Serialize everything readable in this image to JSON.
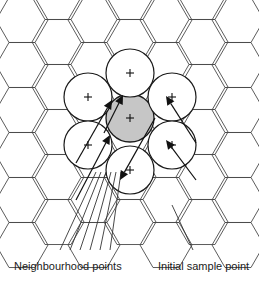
{
  "figure": {
    "background_color": "#ffffff",
    "width": 259,
    "height": 283
  },
  "colors": {
    "hex_stroke": "#4a4a4a",
    "circle_stroke": "#1a1a1a",
    "circle_fill": "#ffffff",
    "shaded_fill": "#c6c6c6",
    "arrow": "#111111",
    "leader": "#333333",
    "text": "#1b1b1b"
  },
  "grid": {
    "type": "hexagonal",
    "orientation": "flat-top",
    "hex_radius": 26,
    "columns": 5,
    "rows": 6,
    "hexagons": [
      {
        "cx": 22,
        "cy": 20
      },
      {
        "cx": 22,
        "cy": 65
      },
      {
        "cx": 22,
        "cy": 110
      },
      {
        "cx": 22,
        "cy": 155
      },
      {
        "cx": 22,
        "cy": 200
      },
      {
        "cx": 22,
        "cy": 245
      },
      {
        "cx": 58,
        "cy": 42
      },
      {
        "cx": 58,
        "cy": 87
      },
      {
        "cx": 58,
        "cy": 132
      },
      {
        "cx": 58,
        "cy": 177
      },
      {
        "cx": 58,
        "cy": 222
      },
      {
        "cx": 58,
        "cy": -3
      },
      {
        "cx": 94,
        "cy": 20
      },
      {
        "cx": 94,
        "cy": 65
      },
      {
        "cx": 94,
        "cy": 110
      },
      {
        "cx": 94,
        "cy": 155
      },
      {
        "cx": 94,
        "cy": 200
      },
      {
        "cx": 94,
        "cy": 245
      },
      {
        "cx": 130,
        "cy": 42
      },
      {
        "cx": 130,
        "cy": 87
      },
      {
        "cx": 130,
        "cy": 132
      },
      {
        "cx": 130,
        "cy": 177
      },
      {
        "cx": 130,
        "cy": 222
      },
      {
        "cx": 130,
        "cy": -3
      },
      {
        "cx": 166,
        "cy": 20
      },
      {
        "cx": 166,
        "cy": 65
      },
      {
        "cx": 166,
        "cy": 110
      },
      {
        "cx": 166,
        "cy": 155
      },
      {
        "cx": 166,
        "cy": 200
      },
      {
        "cx": 166,
        "cy": 245
      },
      {
        "cx": 202,
        "cy": 42
      },
      {
        "cx": 202,
        "cy": 87
      },
      {
        "cx": 202,
        "cy": 132
      },
      {
        "cx": 202,
        "cy": 177
      },
      {
        "cx": 202,
        "cy": 222
      },
      {
        "cx": 202,
        "cy": -3
      },
      {
        "cx": 238,
        "cy": 20
      },
      {
        "cx": 238,
        "cy": 65
      },
      {
        "cx": 238,
        "cy": 110
      },
      {
        "cx": 238,
        "cy": 155
      },
      {
        "cx": 238,
        "cy": 200
      },
      {
        "cx": 238,
        "cy": 245
      }
    ]
  },
  "sample_points": {
    "radius": 24,
    "marker": "+",
    "initial": {
      "label": "initial-sample-point",
      "cx": 130,
      "cy": 118,
      "shaded": true
    },
    "neighbours": [
      {
        "label": "neighbour-top",
        "cx": 130,
        "cy": 73,
        "shaded": false
      },
      {
        "label": "neighbour-upper-left",
        "cx": 88,
        "cy": 97,
        "shaded": false
      },
      {
        "label": "neighbour-upper-right",
        "cx": 172,
        "cy": 97,
        "shaded": false
      },
      {
        "label": "neighbour-lower-left",
        "cx": 88,
        "cy": 145,
        "shaded": false
      },
      {
        "label": "neighbour-lower-right",
        "cx": 172,
        "cy": 145,
        "shaded": false
      },
      {
        "label": "neighbour-bottom",
        "cx": 130,
        "cy": 170,
        "shaded": false
      }
    ]
  },
  "arrows": [
    {
      "name": "arrow-from-upper-left",
      "x1": 76,
      "y1": 163,
      "x2": 112,
      "y2": 100
    },
    {
      "name": "arrow-from-lower-left",
      "x1": 76,
      "y1": 200,
      "x2": 110,
      "y2": 135
    },
    {
      "name": "arrow-from-top",
      "x1": 104,
      "y1": 133,
      "x2": 123,
      "y2": 95
    },
    {
      "name": "arrow-from-bottom",
      "x1": 155,
      "y1": 118,
      "x2": 120,
      "y2": 180
    },
    {
      "name": "arrow-from-upper-right",
      "x1": 196,
      "y1": 143,
      "x2": 166,
      "y2": 96
    },
    {
      "name": "arrow-from-lower-right",
      "x1": 196,
      "y1": 180,
      "x2": 166,
      "y2": 140
    }
  ],
  "leaders": [
    {
      "name": "leader-neighbour-1",
      "x1": 60,
      "y1": 250,
      "x2": 96,
      "y2": 172
    },
    {
      "name": "leader-neighbour-2",
      "x1": 70,
      "y1": 250,
      "x2": 101,
      "y2": 172
    },
    {
      "name": "leader-neighbour-3",
      "x1": 80,
      "y1": 250,
      "x2": 106,
      "y2": 172
    },
    {
      "name": "leader-neighbour-4",
      "x1": 90,
      "y1": 250,
      "x2": 111,
      "y2": 172
    },
    {
      "name": "leader-neighbour-5",
      "x1": 100,
      "y1": 250,
      "x2": 116,
      "y2": 172
    },
    {
      "name": "leader-neighbour-6",
      "x1": 110,
      "y1": 250,
      "x2": 121,
      "y2": 172
    },
    {
      "name": "leader-initial",
      "x1": 193,
      "y1": 250,
      "x2": 172,
      "y2": 205
    }
  ],
  "labels": {
    "neighbourhood": {
      "text": "Neighbourhood points",
      "x": 14,
      "y": 270
    },
    "initial": {
      "text": "Initial sample point",
      "x": 158,
      "y": 270
    }
  }
}
